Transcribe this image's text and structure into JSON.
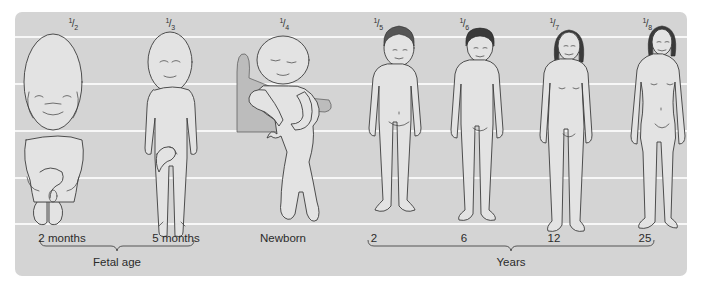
{
  "figure": {
    "panel_color": "#d4d4d4",
    "line_color": "#f7f7f7",
    "stages": [
      {
        "fraction_num": "1",
        "fraction_den": "2",
        "age_label": "2 months",
        "x": 73
      },
      {
        "fraction_num": "1",
        "fraction_den": "3",
        "age_label": "5 months",
        "x": 170
      },
      {
        "fraction_num": "1",
        "fraction_den": "4",
        "age_label": "Newborn",
        "x": 284
      },
      {
        "fraction_num": "1",
        "fraction_den": "5",
        "age_label": "2",
        "x": 384
      },
      {
        "fraction_num": "1",
        "fraction_den": "6",
        "age_label": "6",
        "x": 465
      },
      {
        "fraction_num": "1",
        "fraction_den": "7",
        "age_label": "12",
        "x": 554
      },
      {
        "fraction_num": "1",
        "fraction_den": "8",
        "age_label": "25",
        "x": 647
      }
    ],
    "groups": [
      {
        "label": "Fetal age",
        "from_stage": 0,
        "to_stage": 1
      },
      {
        "label": "Years",
        "from_stage": 3,
        "to_stage": 6
      }
    ],
    "horizontal_lines_y": [
      25,
      72,
      119,
      166,
      212
    ]
  }
}
